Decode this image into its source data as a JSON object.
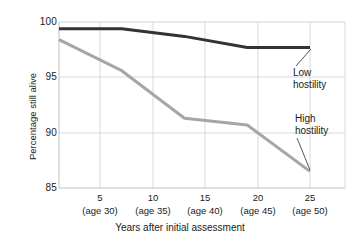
{
  "chart_data": {
    "type": "line",
    "title": "",
    "xlabel": "Years after initial assessment",
    "ylabel": "Percentage still alive",
    "x": [
      5,
      10,
      15,
      20,
      25
    ],
    "categories": [
      "5\n(age 30)",
      "10\n(age 35)",
      "15\n(age 40)",
      "20\n(age 45)",
      "25\n(age 50)"
    ],
    "xtick_labels": [
      "5",
      "10",
      "15",
      "20",
      "25"
    ],
    "xtick_sublabels": [
      "(age 30)",
      "(age 35)",
      "(age 40)",
      "(age 45)",
      "(age 50)"
    ],
    "ytick_labels": [
      "100",
      "95",
      "90",
      "85"
    ],
    "ytick_values": [
      100,
      95,
      90,
      85
    ],
    "ylim": [
      85,
      100
    ],
    "xlim": [
      2.5,
      27.5
    ],
    "grid": true,
    "legend_position": "inline-annotations",
    "series": [
      {
        "name": "Low hostility",
        "color": "#333333",
        "values": [
          99.4,
          99.4,
          98.7,
          97.7,
          97.7
        ]
      },
      {
        "name": "High hostility",
        "color": "#a6a6a6",
        "values": [
          98.4,
          95.6,
          91.3,
          90.7,
          86.5
        ]
      }
    ],
    "annotations": [
      {
        "text_line1": "Low",
        "text_line2": "hostility",
        "target_series": "Low hostility"
      },
      {
        "text_line1": "High",
        "text_line2": "hostility",
        "target_series": "High hostility"
      }
    ]
  },
  "colors": {
    "background": "#ffffff",
    "axis": "#c8c8c8",
    "grid": "#d9d9d9",
    "text": "#1a1a1a",
    "low_hostility_line": "#333333",
    "high_hostility_line": "#a6a6a6",
    "leader_line": "#555555"
  }
}
